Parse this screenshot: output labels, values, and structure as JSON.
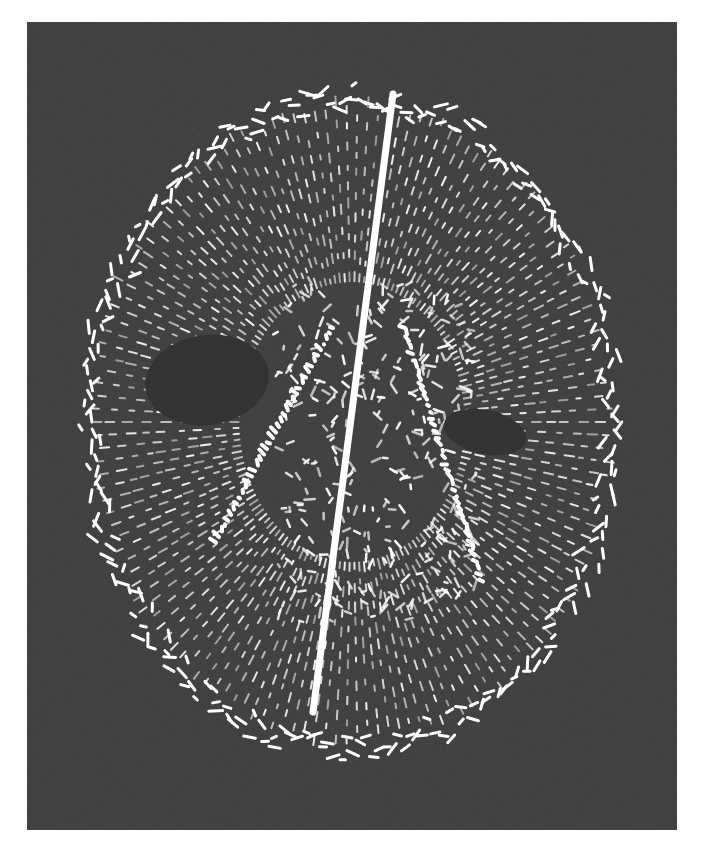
{
  "figure": {
    "background_color": "#3a3a3a",
    "foreground_color": "#ffffff",
    "page_background": "#ffffff",
    "panel": {
      "x": 27,
      "y": 22,
      "width": 650,
      "height": 808
    }
  }
}
